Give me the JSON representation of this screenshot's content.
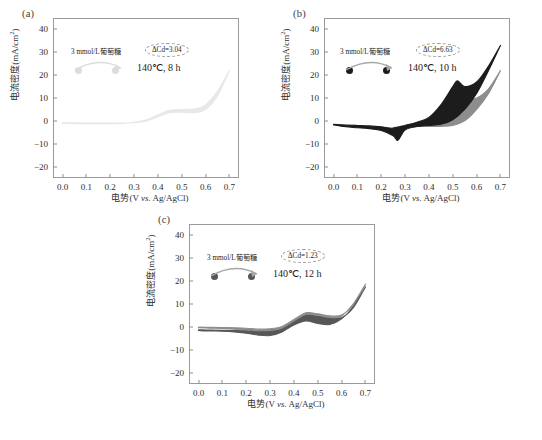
{
  "figure": {
    "axis": {
      "xlabel_cn": "电势",
      "xlabel_unit": "(V ",
      "xlabel_vs": "vs.",
      "xlabel_tail": " Ag/AgCl)",
      "ylabel_cn": "电流密度(mA/cm",
      "ylabel_sup": "2",
      "ylabel_tail": ")",
      "xticks": [
        "0.0",
        "0.1",
        "0.2",
        "0.3",
        "0.4",
        "0.5",
        "0.6",
        "0.7"
      ],
      "yticks": [
        "40",
        "30",
        "20",
        "10",
        "0",
        "-10",
        "-20"
      ],
      "xlim": [
        -0.04,
        0.74
      ],
      "ylim": [
        -25,
        45
      ]
    },
    "panels": [
      {
        "id": "a",
        "label": "(a)",
        "concentration": "3 mmol/L葡萄糖",
        "delta_cd": "ΔCd=3.04",
        "condition": "140℃, 8 h",
        "curve_color": "#e8e8e8",
        "dot_color": "#dcdcdc"
      },
      {
        "id": "b",
        "label": "(b)",
        "concentration": "3 mmol/L葡萄糖",
        "delta_cd": "ΔCd=6.63",
        "condition": "140℃, 10 h",
        "curve_color": "#1c1c1c",
        "curve_color_secondary": "#8d8d8d",
        "dot_color": "#1c1c1c"
      },
      {
        "id": "c",
        "label": "(c)",
        "concentration": "3 mmol/L葡萄糖",
        "delta_cd": "ΔCd=1.23",
        "condition": "140℃, 12 h",
        "curve_color": "#575757",
        "curve_color_secondary": "#8d8d8d",
        "dot_color": "#575757"
      }
    ]
  },
  "chart_data": {
    "type": "line",
    "title": "",
    "xlabel": "电势(V vs. Ag/AgCl)",
    "ylabel": "电流密度(mA/cm2)",
    "xlim": [
      -0.04,
      0.74
    ],
    "ylim": [
      -25,
      45
    ],
    "grid": false,
    "legend": "none",
    "panels": [
      {
        "panel": "a",
        "annotation": "3 mmol/L葡萄糖, ΔCd=3.04, 140℃, 8 h",
        "series": [
          {
            "name": "forward-scan",
            "x": [
              0.0,
              0.05,
              0.1,
              0.15,
              0.2,
              0.25,
              0.3,
              0.35,
              0.4,
              0.45,
              0.5,
              0.55,
              0.6,
              0.65,
              0.7
            ],
            "values": [
              -0.8,
              -0.9,
              -1.0,
              -1.0,
              -1.0,
              -1.0,
              -0.8,
              -0.2,
              1.8,
              3.6,
              3.8,
              3.6,
              5.0,
              11.0,
              22.0
            ]
          },
          {
            "name": "reverse-scan",
            "x": [
              0.7,
              0.65,
              0.6,
              0.55,
              0.5,
              0.45,
              0.4,
              0.35,
              0.3,
              0.25,
              0.2,
              0.15,
              0.1,
              0.05,
              0.0
            ],
            "values": [
              22.0,
              13.0,
              7.0,
              5.2,
              5.0,
              4.6,
              2.6,
              0.4,
              -0.6,
              -1.1,
              -1.2,
              -1.2,
              -1.2,
              -1.2,
              -1.1
            ]
          }
        ]
      },
      {
        "panel": "b",
        "annotation": "3 mmol/L葡萄糖, ΔCd=6.63, 140℃, 10 h",
        "series": [
          {
            "name": "dark-forward-scan",
            "x": [
              0.0,
              0.05,
              0.1,
              0.15,
              0.2,
              0.25,
              0.3,
              0.35,
              0.4,
              0.45,
              0.5,
              0.52,
              0.55,
              0.6,
              0.65,
              0.7
            ],
            "values": [
              -1.5,
              -1.8,
              -2.0,
              -2.2,
              -2.6,
              -3.2,
              -2.0,
              -0.6,
              1.5,
              7.0,
              15.0,
              17.5,
              15.0,
              17.0,
              24.0,
              33.0
            ]
          },
          {
            "name": "dark-reverse-scan",
            "x": [
              0.7,
              0.65,
              0.6,
              0.55,
              0.5,
              0.45,
              0.4,
              0.35,
              0.3,
              0.27,
              0.25,
              0.2,
              0.15,
              0.1,
              0.05,
              0.0
            ],
            "values": [
              33.0,
              22.0,
              12.0,
              5.0,
              0.5,
              -1.5,
              -2.0,
              -2.5,
              -4.0,
              -8.5,
              -6.5,
              -4.2,
              -3.4,
              -3.0,
              -2.6,
              -1.8
            ]
          },
          {
            "name": "gray-forward-scan",
            "x": [
              0.25,
              0.3,
              0.35,
              0.4,
              0.45,
              0.5,
              0.55,
              0.6,
              0.65,
              0.7
            ],
            "values": [
              -3.0,
              -2.0,
              -0.8,
              1.0,
              4.0,
              8.0,
              9.5,
              10.0,
              14.0,
              22.0
            ]
          },
          {
            "name": "gray-reverse-scan",
            "x": [
              0.7,
              0.65,
              0.6,
              0.55,
              0.5,
              0.45,
              0.4,
              0.35,
              0.3,
              0.25
            ],
            "values": [
              22.0,
              12.0,
              5.0,
              0.0,
              -2.0,
              -2.4,
              -2.4,
              -2.4,
              -2.6,
              -3.0
            ]
          }
        ]
      },
      {
        "panel": "c",
        "annotation": "3 mmol/L葡萄糖, ΔCd=1.23, 140℃, 12 h",
        "series": [
          {
            "name": "forward-scan",
            "x": [
              0.0,
              0.05,
              0.1,
              0.15,
              0.2,
              0.25,
              0.3,
              0.35,
              0.4,
              0.45,
              0.5,
              0.55,
              0.6,
              0.65,
              0.7
            ],
            "values": [
              -1.3,
              -1.4,
              -1.5,
              -1.6,
              -1.8,
              -2.2,
              -2.0,
              -1.0,
              2.0,
              5.0,
              4.5,
              3.6,
              4.0,
              8.5,
              17.5
            ]
          },
          {
            "name": "reverse-scan",
            "x": [
              0.7,
              0.65,
              0.6,
              0.55,
              0.5,
              0.45,
              0.4,
              0.35,
              0.3,
              0.25,
              0.2,
              0.15,
              0.1,
              0.05,
              0.0
            ],
            "values": [
              17.5,
              9.0,
              3.5,
              1.0,
              1.5,
              2.6,
              0.8,
              -2.2,
              -3.8,
              -3.6,
              -2.8,
              -2.2,
              -1.9,
              -1.8,
              -1.6
            ]
          }
        ]
      }
    ]
  }
}
